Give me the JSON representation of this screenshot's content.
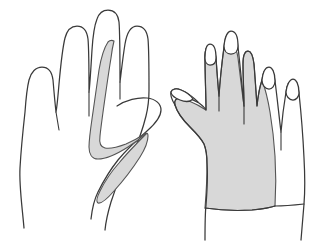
{
  "figure": {
    "title": "Hand dermatome / sensory distribution diagram",
    "caption": "",
    "background_color": "#ffffff",
    "outline_color": "#3a3a3a",
    "shade_fill_color": "#d8d8d8",
    "shade_stroke_color": "#555555",
    "width_px": 329,
    "height_px": 243
  },
  "hands": [
    {
      "id": "left-hand",
      "label": "Palmar view, left hand",
      "position": "left",
      "view": "palmar",
      "fill": "#ffffff",
      "digits": [
        {
          "name": "little-finger",
          "shaded": false
        },
        {
          "name": "ring-finger",
          "shaded": false
        },
        {
          "name": "middle-finger",
          "shaded": false
        },
        {
          "name": "index-finger",
          "shaded": true
        },
        {
          "name": "thumb",
          "shaded": true
        }
      ],
      "shaded_regions": [
        {
          "id": "left-hook-region",
          "label": "Radial index finger and thenar hook band",
          "fill": "#d8d8d8"
        },
        {
          "id": "left-thumb-stripe",
          "label": "Thumb lens-shaped stripe",
          "fill": "#d8d8d8"
        }
      ]
    },
    {
      "id": "right-hand",
      "label": "Dorsal view, right hand",
      "position": "right",
      "view": "dorsal",
      "fill": "#ffffff",
      "digits": [
        {
          "name": "thumb",
          "shaded": true
        },
        {
          "name": "index-finger",
          "shaded": true
        },
        {
          "name": "middle-finger",
          "shaded": true
        },
        {
          "name": "ring-finger",
          "shaded": false
        },
        {
          "name": "little-finger",
          "shaded": false
        }
      ],
      "shaded_regions": [
        {
          "id": "right-dorsum-region",
          "label": "Dorsum of hand with thumb, index and middle fingers",
          "fill": "#d8d8d8"
        }
      ],
      "nails": [
        {
          "name": "thumb-nail",
          "shaded": false
        },
        {
          "name": "index-nail",
          "shaded": false
        },
        {
          "name": "middle-nail",
          "shaded": false
        },
        {
          "name": "ring-nail",
          "shaded": false
        },
        {
          "name": "little-nail",
          "shaded": false
        }
      ]
    }
  ]
}
